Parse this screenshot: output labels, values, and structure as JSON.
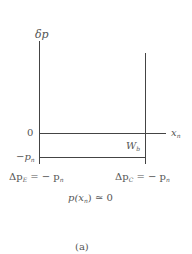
{
  "figure": {
    "y_axis_label": "δp",
    "x_axis_label": "x",
    "x_axis_sub": "n",
    "zero_tick": "0",
    "neg_tick": "−p",
    "neg_tick_sub": "n",
    "width_label": "W",
    "width_label_sub": "b",
    "emitter_bc": {
      "prefix": "Δp",
      "sub": "E",
      "rhs": "= − p",
      "rhs_sub": "n"
    },
    "collector_bc": {
      "prefix": "Δp",
      "sub": "C",
      "rhs": "= − p",
      "rhs_sub": "n"
    },
    "condition": "p(x",
    "condition_sub": "n",
    "condition_rest": ") ≃ 0",
    "caption": "(a)"
  },
  "colors": {
    "line": "#444444",
    "text": "#555555"
  }
}
